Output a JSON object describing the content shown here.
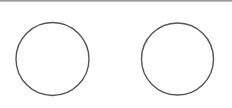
{
  "colors": {
    "background": "#ffffff",
    "stroke": "#555555",
    "topbar": "#8a8a8a"
  },
  "shapes": [
    {
      "type": "circle",
      "cx": 52.5,
      "cy": 59,
      "r": 36.5
    },
    {
      "type": "circle",
      "cx": 177.5,
      "cy": 59,
      "r": 36
    }
  ]
}
